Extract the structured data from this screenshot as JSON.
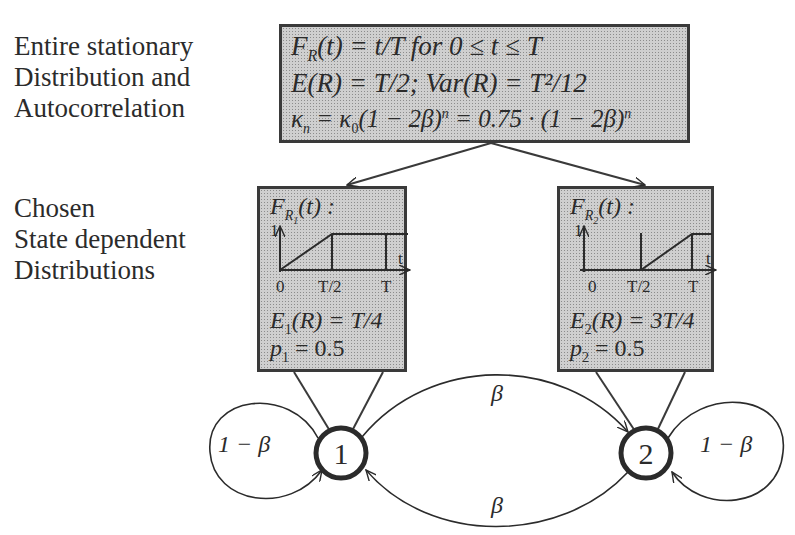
{
  "left_labels": {
    "top": [
      "Entire stationary",
      "Distribution and",
      "Autocorrelation"
    ],
    "middle": [
      "Chosen",
      "State dependent",
      "Distributions"
    ]
  },
  "top_box": {
    "line1": "F_R(t) = t/T for 0 ≤ t ≤ T",
    "line1_parts": {
      "f": "F",
      "sub": "R",
      "rest": "(t) = t/T for 0 ≤ t ≤ T"
    },
    "line2": "E(R) = T/2; Var(R) = T²/12",
    "line3": "κ_n = κ_0(1 − 2β)^n = 0.75 · (1 − 2β)^n",
    "line3_parts": {
      "a": "κ",
      "a_sub": "n",
      "b": " = κ",
      "b_sub": "0",
      "c": "(1 − 2β)",
      "c_sup": "n",
      "d": " = 0.75 · (1 − 2β)",
      "d_sup": "n"
    }
  },
  "state_boxes": [
    {
      "title": "F_R1(t) :",
      "title_parts": {
        "f": "F",
        "sub": "R",
        "subsub": "1",
        "rest": "(t) :"
      },
      "plot": {
        "y_label": "1",
        "x_label": "t",
        "ticks": [
          "0",
          "T/2",
          "T"
        ],
        "shape": "ramp 0→1 from 0 to T/2, then flat at 1"
      },
      "expectation": "E1(R) = T/4",
      "expectation_parts": {
        "e": "E",
        "sub": "1",
        "rest": "(R) = T/4"
      },
      "probability": "p1 = 0.5",
      "probability_parts": {
        "p": "p",
        "sub": "1",
        "rest": " = 0.5"
      }
    },
    {
      "title": "F_R2(t) :",
      "title_parts": {
        "f": "F",
        "sub": "R",
        "subsub": "2",
        "rest": "(t) :"
      },
      "plot": {
        "y_label": "1",
        "x_label": "t",
        "ticks": [
          "0",
          "T/2",
          "T"
        ],
        "shape": "0 until T/2, ramp 0→1 from T/2 to T"
      },
      "expectation": "E2(R) = 3T/4",
      "expectation_parts": {
        "e": "E",
        "sub": "2",
        "rest": "(R) = 3T/4"
      },
      "probability": "p2 = 0.5",
      "probability_parts": {
        "p": "p",
        "sub": "2",
        "rest": " = 0.5"
      }
    }
  ],
  "markov_chain": {
    "states": [
      {
        "id": "1",
        "label": "1"
      },
      {
        "id": "2",
        "label": "2"
      }
    ],
    "transitions": [
      {
        "from": "1",
        "to": "1",
        "label": "1 − β"
      },
      {
        "from": "1",
        "to": "2",
        "label": "β"
      },
      {
        "from": "2",
        "to": "1",
        "label": "β"
      },
      {
        "from": "2",
        "to": "2",
        "label": "1 − β"
      }
    ]
  },
  "colors": {
    "ink": "#2b2b2b",
    "box_fill": "#cfcfcf",
    "box_dots": "#8c8c8c",
    "background": "#ffffff"
  }
}
